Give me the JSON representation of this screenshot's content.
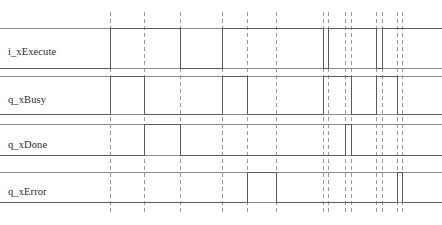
{
  "diagram": {
    "type": "timing-diagram",
    "width": 442,
    "height": 225,
    "background_color": "#ffffff",
    "signal_color": "#5a5a5a",
    "rail_color": "#8d8d8d",
    "gridline_color": "#9a9a9a",
    "label_color": "#2b2b2b",
    "gridlines_x": [
      110,
      144,
      180,
      222,
      247,
      276,
      323,
      328,
      345,
      351,
      376,
      382,
      397,
      402
    ],
    "grid_top": 12,
    "grid_bottom": 214,
    "signals": [
      {
        "name": "i_xExecute",
        "label": "i_xExecute",
        "label_x": 8,
        "label_y": 47,
        "y_high": 28,
        "y_low": 68,
        "initial": 0,
        "transitions": [
          {
            "x": 110,
            "to": 1
          },
          {
            "x": 180,
            "to": 0
          },
          {
            "x": 222,
            "to": 1
          },
          {
            "x": 323,
            "to": 0
          },
          {
            "x": 328,
            "to": 1
          },
          {
            "x": 376,
            "to": 0
          },
          {
            "x": 382,
            "to": 1
          }
        ]
      },
      {
        "name": "q_xBusy",
        "label": "q_xBusy",
        "label_x": 8,
        "label_y": 95,
        "y_high": 76,
        "y_low": 114,
        "initial": 0,
        "transitions": [
          {
            "x": 110,
            "to": 1
          },
          {
            "x": 144,
            "to": 0
          },
          {
            "x": 222,
            "to": 1
          },
          {
            "x": 247,
            "to": 0
          },
          {
            "x": 323,
            "to": 1
          },
          {
            "x": 351,
            "to": 0
          },
          {
            "x": 376,
            "to": 1
          },
          {
            "x": 397,
            "to": 0
          }
        ]
      },
      {
        "name": "q_xDone",
        "label": "q_xDone",
        "label_x": 8,
        "label_y": 140,
        "y_high": 124,
        "y_low": 155,
        "initial": 0,
        "transitions": [
          {
            "x": 144,
            "to": 1
          },
          {
            "x": 180,
            "to": 0
          },
          {
            "x": 345,
            "to": 1
          },
          {
            "x": 351,
            "to": 0
          }
        ]
      },
      {
        "name": "q_xError",
        "label": "q_xError",
        "label_x": 8,
        "label_y": 187,
        "y_high": 172,
        "y_low": 202,
        "initial": 0,
        "transitions": [
          {
            "x": 247,
            "to": 1
          },
          {
            "x": 276,
            "to": 0
          },
          {
            "x": 397,
            "to": 1
          },
          {
            "x": 402,
            "to": 0
          }
        ]
      }
    ]
  }
}
